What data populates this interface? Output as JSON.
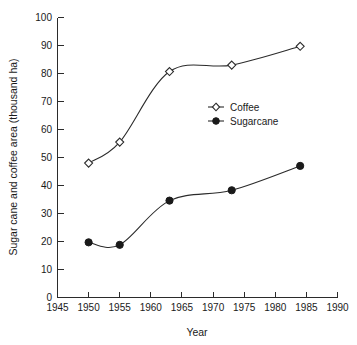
{
  "chart_data": {
    "type": "line",
    "title": "",
    "xlabel": "Year",
    "ylabel": "Sugar cane and coffee area (thousand ha)",
    "xlim": [
      1945,
      1990
    ],
    "ylim": [
      0,
      100
    ],
    "xticks": [
      1945,
      1950,
      1955,
      1960,
      1965,
      1970,
      1975,
      1980,
      1985,
      1990
    ],
    "yticks": [
      0,
      10,
      20,
      30,
      40,
      50,
      60,
      70,
      80,
      90,
      100
    ],
    "grid": false,
    "legend_position": "center-right",
    "series": [
      {
        "name": "Coffee",
        "marker": "open-diamond",
        "x": [
          1950,
          1955,
          1963,
          1973,
          1984
        ],
        "values": [
          48.0,
          55.5,
          80.7,
          83.0,
          89.7
        ]
      },
      {
        "name": "Sugarcane",
        "marker": "filled-circle",
        "x": [
          1950,
          1955,
          1963,
          1973,
          1984
        ],
        "values": [
          19.7,
          18.8,
          34.6,
          38.3,
          47.0
        ]
      }
    ]
  },
  "axes": {
    "y_title": "Sugar cane and coffee area (thousand ha)",
    "x_title": "Year",
    "y_tick_labels": [
      "0",
      "10",
      "20",
      "30",
      "40",
      "50",
      "60",
      "70",
      "80",
      "90",
      "100"
    ],
    "x_tick_labels": [
      "1945",
      "1950",
      "1955",
      "1960",
      "1965",
      "1970",
      "1975",
      "1980",
      "1985",
      "1990"
    ]
  },
  "legend": {
    "entries": [
      {
        "label": "Coffee",
        "marker": "open-diamond-icon"
      },
      {
        "label": "Sugarcane",
        "marker": "filled-circle-icon"
      }
    ]
  },
  "colors": {
    "ink": "#1a1a1a",
    "axis": "#2b2b2b",
    "background": "#ffffff"
  }
}
